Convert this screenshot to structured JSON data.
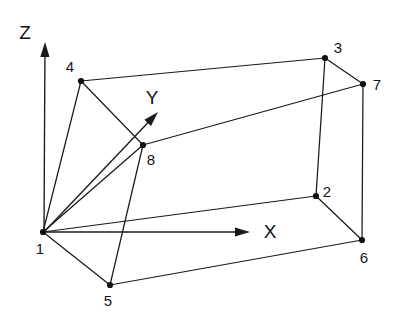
{
  "figure": {
    "kind": "3d-hexahedral-element-node-numbering-diagram",
    "background_color": "#ffffff",
    "line_color": "#1a1a1a",
    "text_color": "#141414",
    "width": 394,
    "height": 319
  },
  "axes": [
    {
      "id": "z",
      "label": "Z",
      "label_x": 25,
      "label_y": 32,
      "origin_x": 44,
      "origin_y": 232,
      "tip_x": 45,
      "tip_y": 42
    },
    {
      "id": "y",
      "label": "Y",
      "label_x": 152,
      "label_y": 97,
      "origin_x": 44,
      "origin_y": 232,
      "tip_x": 158,
      "tip_y": 112
    },
    {
      "id": "x",
      "label": "X",
      "label_x": 270,
      "label_y": 231,
      "origin_x": 44,
      "origin_y": 232,
      "tip_x": 250,
      "tip_y": 232
    }
  ],
  "nodes": [
    {
      "id": "1",
      "label": "1",
      "x": 43,
      "y": 232,
      "label_x": 40,
      "label_y": 248
    },
    {
      "id": "2",
      "label": "2",
      "x": 316,
      "y": 196,
      "label_x": 327,
      "label_y": 191
    },
    {
      "id": "3",
      "label": "3",
      "x": 325,
      "y": 58,
      "label_x": 338,
      "label_y": 47
    },
    {
      "id": "4",
      "label": "4",
      "x": 81,
      "y": 81,
      "label_x": 70,
      "label_y": 66
    },
    {
      "id": "5",
      "label": "5",
      "x": 110,
      "y": 285,
      "label_x": 108,
      "label_y": 300
    },
    {
      "id": "6",
      "label": "6",
      "x": 362,
      "y": 240,
      "label_x": 364,
      "label_y": 257
    },
    {
      "id": "7",
      "label": "7",
      "x": 363,
      "y": 84,
      "label_x": 377,
      "label_y": 84
    },
    {
      "id": "8",
      "label": "8",
      "x": 143,
      "y": 145,
      "label_x": 151,
      "label_y": 159
    }
  ],
  "edges": [
    {
      "id": "e-1-4",
      "from": "1",
      "to": "4",
      "x1": 43,
      "y1": 232,
      "x2": 81,
      "y2": 81
    },
    {
      "id": "e-1-8",
      "from": "1",
      "to": "8",
      "x1": 43,
      "y1": 232,
      "x2": 143,
      "y2": 145
    },
    {
      "id": "e-1-5",
      "from": "1",
      "to": "5",
      "x1": 43,
      "y1": 232,
      "x2": 110,
      "y2": 285
    },
    {
      "id": "e-1-2",
      "from": "1",
      "to": "2",
      "x1": 43,
      "y1": 232,
      "x2": 316,
      "y2": 196
    },
    {
      "id": "e-4-3",
      "from": "4",
      "to": "3",
      "x1": 81,
      "y1": 81,
      "x2": 325,
      "y2": 58
    },
    {
      "id": "e-4-8",
      "from": "4",
      "to": "8",
      "x1": 81,
      "y1": 81,
      "x2": 143,
      "y2": 145
    },
    {
      "id": "e-8-7",
      "from": "8",
      "to": "7",
      "x1": 143,
      "y1": 145,
      "x2": 363,
      "y2": 84
    },
    {
      "id": "e-8-5",
      "from": "8",
      "to": "5",
      "x1": 143,
      "y1": 145,
      "x2": 110,
      "y2": 285
    },
    {
      "id": "e-3-7",
      "from": "3",
      "to": "7",
      "x1": 325,
      "y1": 58,
      "x2": 363,
      "y2": 84
    },
    {
      "id": "e-3-2",
      "from": "3",
      "to": "2",
      "x1": 325,
      "y1": 58,
      "x2": 316,
      "y2": 196
    },
    {
      "id": "e-7-6",
      "from": "7",
      "to": "6",
      "x1": 363,
      "y1": 84,
      "x2": 362,
      "y2": 240
    },
    {
      "id": "e-2-6",
      "from": "2",
      "to": "6",
      "x1": 316,
      "y1": 196,
      "x2": 362,
      "y2": 240
    },
    {
      "id": "e-5-6",
      "from": "5",
      "to": "6",
      "x1": 110,
      "y1": 285,
      "x2": 362,
      "y2": 240
    }
  ]
}
